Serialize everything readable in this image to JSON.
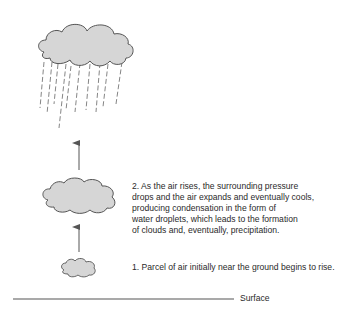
{
  "diagram": {
    "title_cropped": true,
    "colors": {
      "cloud_fill": "#d6d6d6",
      "cloud_stroke": "#555555",
      "rain": "#777777",
      "arrow": "#555555",
      "surface_line": "#555555",
      "text": "#2a2a2a"
    },
    "steps": [
      {
        "id": 1,
        "text": "1. Parcel of air initially near the ground begins to rise."
      },
      {
        "id": 2,
        "lines": [
          "2. As the air rises, the surrounding pressure",
          "drops and the air expands and eventually cools,",
          "producing condensation in the form of",
          "water droplets, which leads to the formation",
          "of clouds and, eventually, precipitation."
        ]
      }
    ],
    "surface_label": "Surface",
    "elements": {
      "clouds": [
        "small-cloud",
        "medium-cloud",
        "rain-cloud"
      ],
      "arrows": [
        "lower-arrow-up",
        "upper-arrow-up"
      ],
      "rain_streaks": 10
    }
  }
}
